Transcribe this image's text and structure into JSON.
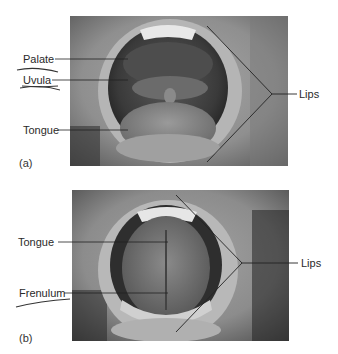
{
  "figure": {
    "panel_a": {
      "letter": "(a)",
      "labels": {
        "palate": "Palate",
        "uvula": "Uvula",
        "tongue": "Tongue",
        "lips": "Lips"
      }
    },
    "panel_b": {
      "letter": "(b)",
      "labels": {
        "tongue": "Tongue",
        "frenulum": "Frenulum",
        "lips": "Lips"
      }
    }
  }
}
